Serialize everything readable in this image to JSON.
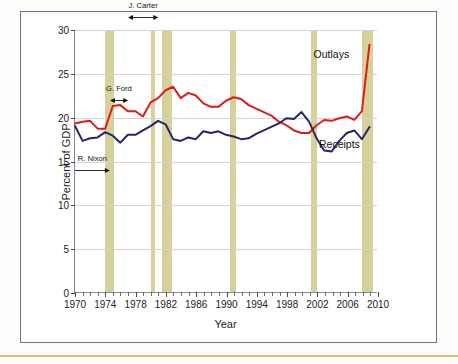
{
  "chart_data": {
    "type": "line",
    "title": "",
    "xlabel": "Year",
    "ylabel": "Percent of GDP",
    "xlim": [
      1970,
      2010
    ],
    "ylim": [
      0,
      30
    ],
    "yticks": [
      0,
      5,
      10,
      15,
      20,
      25,
      30
    ],
    "xticks_major": [
      1970,
      1974,
      1978,
      1982,
      1986,
      1990,
      1994,
      1998,
      2002,
      2006,
      2010
    ],
    "xtick_minor_step": 1,
    "grid": "horizontal",
    "legend_position": "inline-labels",
    "x": [
      1970,
      1971,
      1972,
      1973,
      1974,
      1975,
      1976,
      1977,
      1978,
      1979,
      1980,
      1981,
      1982,
      1983,
      1984,
      1985,
      1986,
      1987,
      1988,
      1989,
      1990,
      1991,
      1992,
      1993,
      1994,
      1995,
      1996,
      1997,
      1998,
      1999,
      2000,
      2001,
      2002,
      2003,
      2004,
      2005,
      2006,
      2007,
      2008,
      2009
    ],
    "series": [
      {
        "name": "Outlays",
        "color": "#e01b14",
        "values": [
          19.3,
          19.5,
          19.6,
          18.7,
          18.7,
          21.3,
          21.4,
          20.7,
          20.7,
          20.1,
          21.7,
          22.2,
          23.1,
          23.5,
          22.2,
          22.8,
          22.5,
          21.6,
          21.2,
          21.2,
          21.9,
          22.3,
          22.1,
          21.4,
          21.0,
          20.6,
          20.2,
          19.5,
          19.1,
          18.5,
          18.2,
          18.2,
          19.1,
          19.7,
          19.6,
          19.9,
          20.1,
          19.7,
          20.7,
          28.3
        ]
      },
      {
        "name": "Receipts",
        "color": "#26246b",
        "values": [
          19.0,
          17.3,
          17.6,
          17.7,
          18.3,
          17.9,
          17.1,
          18.0,
          18.0,
          18.5,
          19.0,
          19.6,
          19.2,
          17.5,
          17.3,
          17.7,
          17.5,
          18.4,
          18.2,
          18.4,
          18.0,
          17.8,
          17.5,
          17.6,
          18.1,
          18.5,
          18.9,
          19.3,
          19.9,
          19.8,
          20.6,
          19.5,
          17.6,
          16.2,
          16.1,
          17.3,
          18.2,
          18.5,
          17.5,
          18.9
        ]
      }
    ],
    "recession_bands": [
      {
        "start": 1973.9,
        "end": 1975.2
      },
      {
        "start": 1980.0,
        "end": 1980.55
      },
      {
        "start": 1981.5,
        "end": 1982.85
      },
      {
        "start": 1990.5,
        "end": 1991.2
      },
      {
        "start": 2001.2,
        "end": 2001.9
      },
      {
        "start": 2007.9,
        "end": 2009.4
      }
    ],
    "annotations": [
      {
        "label": "R. Nixon",
        "start": 1969.0,
        "end": 1974.6,
        "row": 0
      },
      {
        "label": "G. Ford",
        "start": 1974.6,
        "end": 1977.0,
        "row": 1
      },
      {
        "label": "J. Carter",
        "start": 1977.0,
        "end": 1981.0,
        "row": 2
      },
      {
        "label": "R. Reagan",
        "start": 1981.0,
        "end": 1989.0,
        "row": 3
      },
      {
        "label": "G.H.W. Bush",
        "start": 1989.0,
        "end": 1993.0,
        "row": 4
      },
      {
        "label": "W. Clinton",
        "start": 1993.0,
        "end": 2001.0,
        "row": 5
      },
      {
        "label": "G.W. Bush",
        "start": 2001.0,
        "end": 2009.0,
        "row": 6
      },
      {
        "label": "B. Obama",
        "start": 2009.0,
        "end": 2011.0,
        "row": 7
      }
    ],
    "series_labels": [
      {
        "text": "Outlays",
        "x": 2006.2,
        "y": 27.3
      },
      {
        "text": "Receipts",
        "x": 2007.6,
        "y": 17.0
      }
    ]
  },
  "colors": {
    "outlays": "#e01b14",
    "receipts": "#26246b",
    "recession_band": "#cfc98a",
    "frame": "#6f6f93",
    "axis": "#8a8a8a",
    "bottom_rule": "#e8b878"
  }
}
